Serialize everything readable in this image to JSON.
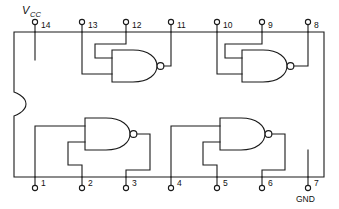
{
  "diagram": {
    "type": "ic-pinout-schematic",
    "package": {
      "pin_count": 14,
      "outline": "rectangle-with-left-notch",
      "notch_side": "left"
    },
    "power_labels": {
      "vcc": "V",
      "vcc_sub": "CC",
      "gnd": "GND"
    },
    "pins_top": [
      {
        "number": "14",
        "x": 35,
        "label": "14"
      },
      {
        "number": "13",
        "x": 82,
        "label": "13"
      },
      {
        "number": "12",
        "x": 126,
        "label": "12"
      },
      {
        "number": "11",
        "x": 171,
        "label": "11"
      },
      {
        "number": "10",
        "x": 217,
        "label": "10"
      },
      {
        "number": "9",
        "x": 262,
        "label": "9"
      },
      {
        "number": "8",
        "x": 308,
        "label": "8"
      }
    ],
    "pins_bottom": [
      {
        "number": "1",
        "x": 35,
        "label": "1"
      },
      {
        "number": "2",
        "x": 82,
        "label": "2"
      },
      {
        "number": "3",
        "x": 126,
        "label": "3"
      },
      {
        "number": "4",
        "x": 171,
        "label": "4"
      },
      {
        "number": "5",
        "x": 217,
        "label": "5"
      },
      {
        "number": "6",
        "x": 262,
        "label": "6"
      },
      {
        "number": "7",
        "x": 308,
        "label": "7"
      }
    ],
    "gates": [
      {
        "id": "gate-top-left",
        "type": "NAND",
        "inputs": [
          "13",
          "12"
        ],
        "output": "11"
      },
      {
        "id": "gate-top-right",
        "type": "NAND",
        "inputs": [
          "10",
          "9"
        ],
        "output": "8"
      },
      {
        "id": "gate-bottom-left",
        "type": "NAND",
        "inputs": [
          "1",
          "2"
        ],
        "output": "3"
      },
      {
        "id": "gate-bottom-right",
        "type": "NAND",
        "inputs": [
          "4",
          "5"
        ],
        "output": "6"
      }
    ],
    "colors": {
      "line": "#1a1a1a",
      "background": "#ffffff",
      "text": "#111111"
    }
  }
}
